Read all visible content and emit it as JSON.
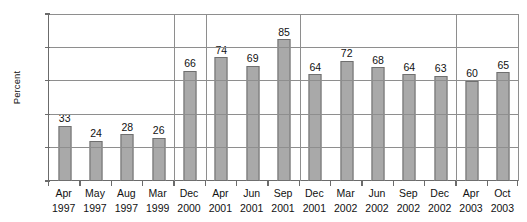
{
  "chart_data": {
    "type": "bar",
    "title": "",
    "xlabel": "",
    "ylabel": "Percent",
    "ylim": [
      0,
      100
    ],
    "ytick_values": [
      0,
      20,
      40,
      60,
      80,
      100
    ],
    "ytick_labels": [
      "0",
      "20",
      "40",
      "60",
      "80",
      "100"
    ],
    "grid": true,
    "legend": "none",
    "categories": [
      "Apr 1997",
      "May 1997",
      "Aug 1997",
      "Mar 1999",
      "Dec 2000",
      "Apr 2001",
      "Jun 2001",
      "Sep 2001",
      "Dec 2001",
      "Mar 2002",
      "Jun 2002",
      "Sep 2002",
      "Dec 2002",
      "Apr 2003",
      "Oct 2003"
    ],
    "category_months": [
      "Apr",
      "May",
      "Aug",
      "Mar",
      "Dec",
      "Apr",
      "Jun",
      "Sep",
      "Dec",
      "Mar",
      "Jun",
      "Sep",
      "Dec",
      "Apr",
      "Oct"
    ],
    "category_years": [
      "1997",
      "1997",
      "1997",
      "1999",
      "2000",
      "2001",
      "2001",
      "2001",
      "2001",
      "2002",
      "2002",
      "2002",
      "2002",
      "2003",
      "2003"
    ],
    "values": [
      33,
      24,
      28,
      26,
      66,
      74,
      69,
      85,
      64,
      72,
      68,
      64,
      63,
      60,
      65
    ],
    "data_labels": [
      "33",
      "24",
      "28",
      "26",
      "66",
      "74",
      "69",
      "85",
      "64",
      "72",
      "68",
      "64",
      "63",
      "60",
      "65"
    ],
    "group_separators_after_index": [
      3,
      4,
      7,
      12
    ],
    "colors": {
      "bar_fill": "#a9a9a9",
      "bar_border": "#6f6f6f",
      "gridline": "#8e8e8e",
      "axis": "#6b6b6b",
      "text": "#111111",
      "background": "#ffffff"
    }
  }
}
